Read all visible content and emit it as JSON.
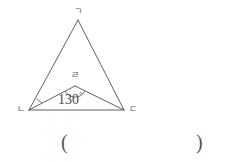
{
  "figure": {
    "type": "geometry-diagram",
    "vertices": [
      {
        "id": "apex",
        "label": "ㄱ",
        "x": 78,
        "y": 20,
        "label_x": 74,
        "label_y": 7
      },
      {
        "id": "bottom-left",
        "label": "ㄴ",
        "x": 29,
        "y": 110,
        "label_x": 17,
        "label_y": 107
      },
      {
        "id": "bottom-right",
        "label": "ㄷ",
        "x": 124,
        "y": 110,
        "label_x": 130,
        "label_y": 107
      },
      {
        "id": "interior",
        "label": "ㄹ",
        "x": 75,
        "y": 86,
        "label_x": 71,
        "label_y": 72
      }
    ],
    "segments": [
      {
        "from": "apex",
        "to": "bottom-left"
      },
      {
        "from": "apex",
        "to": "bottom-right"
      },
      {
        "from": "bottom-left",
        "to": "bottom-right"
      },
      {
        "from": "bottom-left",
        "to": "interior"
      },
      {
        "from": "interior",
        "to": "bottom-right"
      }
    ],
    "angles": [
      {
        "id": "angle-interior",
        "at": "interior",
        "value": "130",
        "degree_symbol": "°",
        "text_x": 59,
        "text_y": 91,
        "arc": {
          "cx": 75,
          "cy": 86,
          "r": 11
        }
      },
      {
        "id": "angle-bottom-left",
        "at": "bottom-left",
        "value": "",
        "arc": {
          "cx": 29,
          "cy": 110,
          "r": 14
        }
      }
    ],
    "stroke_color": "#4f4f4f",
    "stroke_width": 0.9,
    "background_color": "#ffffff"
  },
  "answer": {
    "open_paren": "(",
    "close_paren": ")",
    "value": ""
  }
}
